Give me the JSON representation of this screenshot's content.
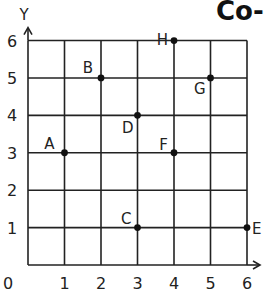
{
  "title": "Co-",
  "chart_data": {
    "type": "scatter",
    "title": "Co-",
    "xlabel": "X",
    "ylabel": "Y",
    "xlim": [
      0,
      6
    ],
    "ylim": [
      0,
      6
    ],
    "grid": true,
    "x_ticks": [
      "0",
      "1",
      "2",
      "3",
      "4",
      "5",
      "6"
    ],
    "y_ticks": [
      "1",
      "2",
      "3",
      "4",
      "5",
      "6"
    ],
    "points": [
      {
        "label": "A",
        "x": 1,
        "y": 3
      },
      {
        "label": "B",
        "x": 2,
        "y": 5
      },
      {
        "label": "C",
        "x": 3,
        "y": 1
      },
      {
        "label": "D",
        "x": 3,
        "y": 4
      },
      {
        "label": "E",
        "x": 6,
        "y": 1
      },
      {
        "label": "F",
        "x": 4,
        "y": 3
      },
      {
        "label": "G",
        "x": 5,
        "y": 5
      },
      {
        "label": "H",
        "x": 4,
        "y": 6
      }
    ]
  },
  "colors": {
    "grid": "#222222",
    "point": "#111111",
    "text": "#222222"
  }
}
